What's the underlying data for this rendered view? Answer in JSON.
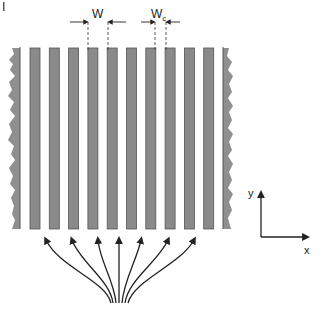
{
  "figure": {
    "panel_mark": "I",
    "strip_count": 10,
    "strip_color": "#8a8a8a",
    "strip_border": "#555555",
    "edge_color": "#8f8f8f",
    "line_color": "#222222",
    "dimension_labels": {
      "w": {
        "main": "W",
        "sub": ""
      },
      "wc": {
        "main": "W",
        "sub": "c"
      }
    },
    "axes": {
      "x_label": "x",
      "y_label": "y"
    },
    "flow_arrows": 7
  }
}
